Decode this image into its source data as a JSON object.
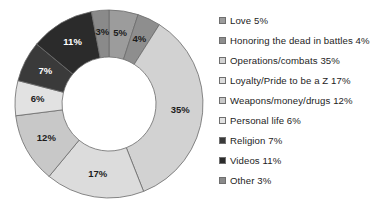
{
  "chart_data": {
    "type": "pie",
    "variant": "donut",
    "title": "",
    "subtitle": "",
    "xlabel": "",
    "ylabel": "",
    "legend_position": "right",
    "grid": false,
    "start_angle_deg": 0,
    "direction": "clockwise",
    "units": "percent",
    "total": 100,
    "categories": [
      "Love",
      "Honoring the dead in battles",
      "Operations/combats",
      "Loyalty/Pride to be a Z",
      "Weapons/money/drugs",
      "Personal life",
      "Religion",
      "Videos",
      "Other"
    ],
    "values": [
      5,
      4,
      35,
      17,
      12,
      6,
      7,
      11,
      3
    ],
    "slice_labels": [
      "5%",
      "4%",
      "35%",
      "17%",
      "12%",
      "6%",
      "7%",
      "11%",
      "3%"
    ],
    "colors": [
      "#9c9c9c",
      "#8e8e8e",
      "#d2d2d2",
      "#dcdcdc",
      "#c8c8c8",
      "#e2e2e2",
      "#3a3a3a",
      "#2b2b2b",
      "#8a8a8a"
    ],
    "label_text_colors": [
      "on-light",
      "on-light",
      "on-light",
      "on-light",
      "on-light",
      "on-light",
      "on-dark",
      "on-dark",
      "on-light"
    ],
    "slice_outline_color": "#6b6b6b",
    "background_color": "#ffffff"
  },
  "legend": {
    "items": [
      {
        "label": "Love 5%",
        "swatch_name": "legend-swatch-love"
      },
      {
        "label": "Honoring the dead in battles 4%",
        "swatch_name": "legend-swatch-honoring-the-dead-in-battles"
      },
      {
        "label": "Operations/combats 35%",
        "swatch_name": "legend-swatch-operations-combats"
      },
      {
        "label": "Loyalty/Pride to be a Z 17%",
        "swatch_name": "legend-swatch-loyalty-pride-to-be-a-z"
      },
      {
        "label": "Weapons/money/drugs 12%",
        "swatch_name": "legend-swatch-weapons-money-drugs"
      },
      {
        "label": "Personal life 6%",
        "swatch_name": "legend-swatch-personal-life"
      },
      {
        "label": "Religion 7%",
        "swatch_name": "legend-swatch-religion"
      },
      {
        "label": "Videos 11%",
        "swatch_name": "legend-swatch-videos"
      },
      {
        "label": "Other 3%",
        "swatch_name": "legend-swatch-other"
      }
    ]
  }
}
